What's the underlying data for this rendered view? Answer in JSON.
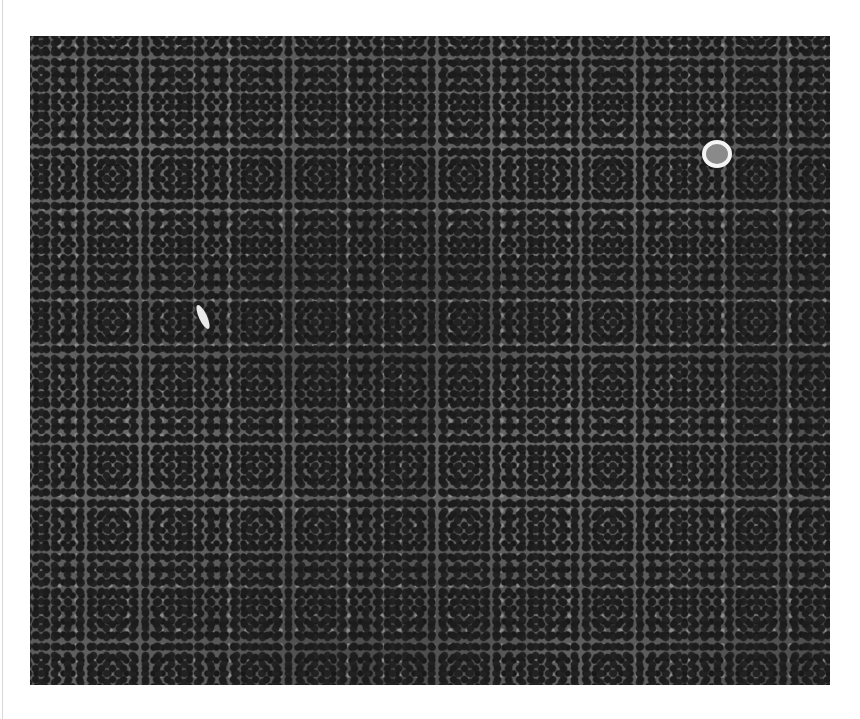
{
  "image": {
    "type": "phase-contrast micrograph",
    "description": "Dense monolayer of cultured cells, grayscale",
    "colors": {
      "background": "#ffffff",
      "cells_dark": "#1c1c1c",
      "cytoplasm": "#5a5a5a",
      "bright_features": "#f4f4f4"
    },
    "features": [
      {
        "name": "bright-round-cell",
        "position": "upper right"
      },
      {
        "name": "elongated-bright-cell",
        "position": "left center"
      }
    ]
  }
}
